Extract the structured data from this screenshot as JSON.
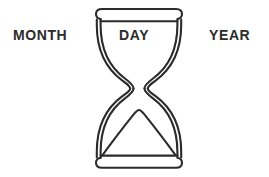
{
  "canvas": {
    "width": 269,
    "height": 177,
    "background_color": "#ffffff"
  },
  "labels": {
    "left": "MONTH",
    "center": "DAY",
    "right": "YEAR"
  },
  "illustration": {
    "name": "hourglass",
    "style": "line-art outline",
    "stroke_color": "#2b2b2b",
    "fill_color": "#ffffff",
    "parts": {
      "top_cap": "top-cap",
      "bottom_cap": "bottom-cap",
      "upper_bulb": "upper-bulb",
      "lower_bulb": "lower-bulb",
      "waist": "waist",
      "sand_mound": "sand-mound"
    }
  },
  "colors": {
    "ink": "#2b2b2b",
    "background": "#ffffff"
  }
}
